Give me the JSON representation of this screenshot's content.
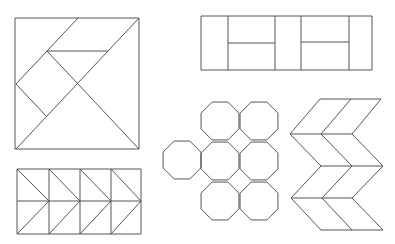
{
  "figure": {
    "width": 395,
    "height": 244,
    "background": "#ffffff",
    "stroke_color": "#555555",
    "stroke_width": 1
  },
  "shapes": {
    "tangram_square": {
      "bbox": [
        15,
        18,
        139,
        149
      ],
      "lines": [
        [
          15,
          18,
          139,
          18
        ],
        [
          139,
          18,
          139,
          149
        ],
        [
          139,
          149,
          15,
          149
        ],
        [
          15,
          149,
          15,
          18
        ],
        [
          139,
          18,
          16,
          149
        ],
        [
          78,
          18,
          16,
          84
        ],
        [
          47,
          51,
          108,
          51
        ],
        [
          47,
          51,
          139,
          149
        ],
        [
          16,
          84,
          47,
          117
        ]
      ]
    },
    "chevron_rectangle": {
      "bbox": [
        17,
        169,
        141,
        234
      ],
      "lines": [
        [
          17,
          169,
          141,
          169
        ],
        [
          141,
          169,
          141,
          234
        ],
        [
          141,
          234,
          17,
          234
        ],
        [
          17,
          234,
          17,
          169
        ],
        [
          17,
          201,
          141,
          201
        ],
        [
          49,
          169,
          49,
          234
        ],
        [
          80,
          169,
          80,
          234
        ],
        [
          111,
          169,
          111,
          234
        ],
        [
          17,
          169,
          49,
          201
        ],
        [
          49,
          201,
          17,
          234
        ],
        [
          49,
          169,
          80,
          201
        ],
        [
          80,
          201,
          49,
          234
        ],
        [
          80,
          169,
          111,
          201
        ],
        [
          111,
          201,
          80,
          234
        ],
        [
          111,
          169,
          141,
          201
        ],
        [
          141,
          201,
          111,
          234
        ]
      ]
    },
    "brick_rectangle": {
      "bbox": [
        201,
        16,
        372,
        70
      ],
      "lines": [
        [
          201,
          16,
          372,
          16
        ],
        [
          372,
          16,
          372,
          70
        ],
        [
          372,
          70,
          201,
          70
        ],
        [
          201,
          70,
          201,
          16
        ],
        [
          228,
          16,
          228,
          70
        ],
        [
          275,
          16,
          275,
          70
        ],
        [
          301,
          16,
          301,
          70
        ],
        [
          349,
          16,
          349,
          70
        ],
        [
          228,
          43,
          275,
          43
        ],
        [
          301,
          42,
          349,
          42
        ]
      ]
    },
    "octagon_tiling": {
      "radius": 20.5,
      "centers": [
        [
          220,
          121
        ],
        [
          259,
          121
        ],
        [
          182,
          160
        ],
        [
          220,
          161
        ],
        [
          259,
          161
        ],
        [
          220,
          201
        ],
        [
          259,
          201
        ]
      ]
    },
    "herringbone": {
      "lines": [
        [
          320,
          99,
          381,
          99
        ],
        [
          320,
          99,
          290,
          134
        ],
        [
          351,
          99,
          321,
          134
        ],
        [
          381,
          99,
          352,
          134
        ],
        [
          290,
          134,
          352,
          134
        ],
        [
          290,
          134,
          321,
          166
        ],
        [
          321,
          134,
          352,
          166
        ],
        [
          352,
          134,
          383,
          166
        ],
        [
          321,
          166,
          383,
          166
        ],
        [
          321,
          166,
          291,
          198
        ],
        [
          352,
          166,
          322,
          198
        ],
        [
          383,
          166,
          352,
          198
        ],
        [
          291,
          198,
          352,
          198
        ],
        [
          291,
          198,
          321,
          230
        ],
        [
          322,
          198,
          352,
          230
        ],
        [
          352,
          198,
          383,
          230
        ],
        [
          321,
          230,
          383,
          230
        ]
      ]
    }
  }
}
